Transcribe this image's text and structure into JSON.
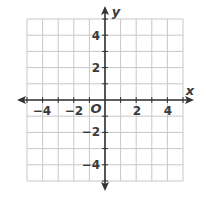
{
  "diagram": {
    "type": "coordinate-plane",
    "x_axis": {
      "label": "x",
      "min": -5,
      "max": 5,
      "tick_labels": [
        "−4",
        "−2",
        "2",
        "4"
      ],
      "tick_values": [
        -4,
        -2,
        2,
        4
      ]
    },
    "y_axis": {
      "label": "y",
      "min": -5,
      "max": 5,
      "tick_labels": [
        "4",
        "2",
        "−2",
        "−4"
      ],
      "tick_values": [
        4,
        2,
        -2,
        -4
      ]
    },
    "origin_label": "O",
    "grid": true,
    "colors": {
      "grid": "#c8c8c8",
      "axis": "#333333",
      "text": "#3a3a3a",
      "background": "#ffffff"
    }
  }
}
